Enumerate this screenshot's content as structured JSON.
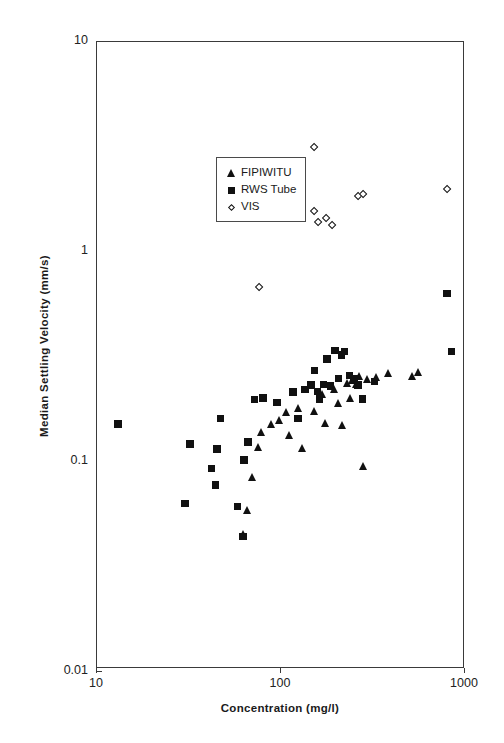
{
  "chart_data": {
    "type": "scatter",
    "title": "",
    "xlabel": "Concentration (mg/l)",
    "ylabel": "Median Settling Velocity (mm/s)",
    "xscale": "log",
    "yscale": "log",
    "xlim": [
      10,
      1000
    ],
    "ylim": [
      0.01,
      10
    ],
    "xticks": [
      "10",
      "100",
      "1000"
    ],
    "xtick_values": [
      10,
      100,
      1000
    ],
    "yticks": [
      "10",
      "1",
      "0.1",
      "0.01"
    ],
    "ytick_values": [
      10,
      1,
      0.1,
      0.01
    ],
    "grid": false,
    "legend_position": "upper-left-inside",
    "series": [
      {
        "name": "FIPIWITU",
        "marker": "triangle",
        "color": "#111111",
        "points": [
          [
            63,
            0.044
          ],
          [
            66,
            0.057
          ],
          [
            70,
            0.082
          ],
          [
            76,
            0.115
          ],
          [
            79,
            0.135
          ],
          [
            89,
            0.148
          ],
          [
            99,
            0.155
          ],
          [
            108,
            0.168
          ],
          [
            112,
            0.131
          ],
          [
            125,
            0.176
          ],
          [
            131,
            0.113
          ],
          [
            152,
            0.17
          ],
          [
            168,
            0.205
          ],
          [
            176,
            0.15
          ],
          [
            196,
            0.218
          ],
          [
            205,
            0.186
          ],
          [
            216,
            0.146
          ],
          [
            232,
            0.232
          ],
          [
            239,
            0.196
          ],
          [
            246,
            0.24
          ],
          [
            258,
            0.23
          ],
          [
            268,
            0.252
          ],
          [
            281,
            0.093
          ],
          [
            296,
            0.243
          ],
          [
            330,
            0.248
          ],
          [
            386,
            0.258
          ],
          [
            520,
            0.252
          ],
          [
            560,
            0.262
          ]
        ]
      },
      {
        "name": "RWS Tube",
        "marker": "square",
        "color": "#111111",
        "points": [
          [
            13,
            0.149
          ],
          [
            30,
            0.062
          ],
          [
            32,
            0.119
          ],
          [
            42,
            0.091
          ],
          [
            44,
            0.076
          ],
          [
            45,
            0.113
          ],
          [
            47,
            0.158
          ],
          [
            58,
            0.06
          ],
          [
            62,
            0.043
          ],
          [
            63,
            0.1
          ],
          [
            66,
            0.122
          ],
          [
            72,
            0.195
          ],
          [
            80,
            0.198
          ],
          [
            95,
            0.188
          ],
          [
            116,
            0.212
          ],
          [
            124,
            0.158
          ],
          [
            135,
            0.218
          ],
          [
            146,
            0.228
          ],
          [
            152,
            0.268
          ],
          [
            158,
            0.213
          ],
          [
            162,
            0.196
          ],
          [
            170,
            0.23
          ],
          [
            178,
            0.305
          ],
          [
            186,
            0.226
          ],
          [
            196,
            0.335
          ],
          [
            205,
            0.245
          ],
          [
            213,
            0.318
          ],
          [
            222,
            0.33
          ],
          [
            236,
            0.253
          ],
          [
            249,
            0.244
          ],
          [
            262,
            0.228
          ],
          [
            277,
            0.196
          ],
          [
            322,
            0.238
          ],
          [
            800,
            0.626
          ],
          [
            845,
            0.33
          ]
        ]
      },
      {
        "name": "VIS",
        "marker": "diamond",
        "color": "#111111",
        "points": [
          [
            76,
            0.675
          ],
          [
            93,
            1.96
          ],
          [
            152,
            3.15
          ],
          [
            152,
            1.55
          ],
          [
            160,
            1.38
          ],
          [
            176,
            1.44
          ],
          [
            190,
            1.33
          ],
          [
            264,
            1.83
          ],
          [
            278,
            1.88
          ],
          [
            800,
            1.97
          ]
        ]
      }
    ]
  },
  "legend": {
    "items": [
      {
        "label": "FIPIWITU",
        "marker": "triangle"
      },
      {
        "label": "RWS Tube",
        "marker": "square"
      },
      {
        "label": "VIS",
        "marker": "diamond"
      }
    ]
  }
}
